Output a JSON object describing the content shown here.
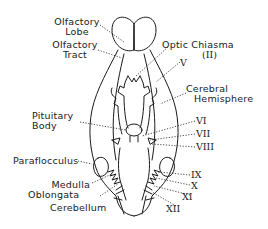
{
  "diagram": {
    "labels": {
      "olfactory_lobe_1": "Olfactory",
      "olfactory_lobe_2": "Lobe",
      "olfactory_tract_1": "Olfactory",
      "olfactory_tract_2": "Tract",
      "optic_chiasma_1": "Optic Chiasma",
      "optic_chiasma_2": "(II)",
      "nerve_v": "V",
      "cerebral_hemisphere_1": "Cerebral",
      "cerebral_hemisphere_2": "Hemisphere",
      "pituitary_body_1": "Pituitary",
      "pituitary_body_2": "Body",
      "nerve_vi": "VI",
      "nerve_vii": "VII",
      "nerve_viii": "VIII",
      "paraflocculus": "Paraflocculus",
      "nerve_ix": "IX",
      "nerve_x": "X",
      "medulla_oblongata_1": "Medulla",
      "medulla_oblongata_2": "Oblongata",
      "nerve_xi": "XI",
      "cerebellum": "Cerebellum",
      "nerve_xii": "XII"
    },
    "colors": {
      "line": "#1a1a1a",
      "background": "#ffffff"
    }
  }
}
